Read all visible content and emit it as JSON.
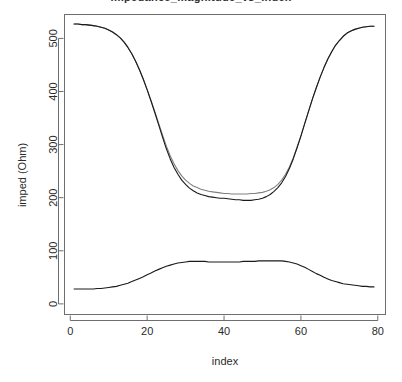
{
  "chart_data": {
    "type": "line",
    "title": "impedance_magnitude_vs_index",
    "xlabel": "index",
    "ylabel": "imped (Ohm)",
    "xlim": [
      -1.5,
      82
    ],
    "ylim": [
      -20,
      545
    ],
    "xticks": [
      0,
      20,
      40,
      60,
      80
    ],
    "yticks": [
      0,
      100,
      200,
      300,
      400,
      500
    ],
    "grid": false,
    "legend": "none",
    "x": [
      1,
      2,
      3,
      4,
      5,
      6,
      7,
      8,
      9,
      10,
      11,
      12,
      13,
      14,
      15,
      16,
      17,
      18,
      19,
      20,
      21,
      22,
      23,
      24,
      25,
      26,
      27,
      28,
      29,
      30,
      31,
      32,
      33,
      34,
      35,
      36,
      37,
      38,
      39,
      40,
      41,
      42,
      43,
      44,
      45,
      46,
      47,
      48,
      49,
      50,
      51,
      52,
      53,
      54,
      55,
      56,
      57,
      58,
      59,
      60,
      61,
      62,
      63,
      64,
      65,
      66,
      67,
      68,
      69,
      70,
      71,
      72,
      73,
      74,
      75,
      76,
      77,
      78,
      79
    ],
    "series": [
      {
        "name": "imped-measured",
        "color": "#808080",
        "values": [
          527,
          527,
          526,
          526,
          525,
          524,
          523,
          521,
          519,
          516,
          512,
          507,
          501,
          493,
          483,
          471,
          457,
          441,
          423,
          404,
          383,
          362,
          340,
          318,
          297,
          279,
          264,
          251,
          241,
          233,
          227,
          222,
          219,
          216,
          214,
          212,
          211,
          210,
          209,
          208,
          208,
          207,
          207,
          207,
          207,
          207,
          208,
          208,
          209,
          210,
          212,
          215,
          219,
          225,
          233,
          244,
          258,
          275,
          295,
          317,
          340,
          363,
          386,
          407,
          427,
          445,
          461,
          475,
          487,
          496,
          504,
          510,
          514,
          517,
          519,
          521,
          522,
          523,
          523
        ]
      },
      {
        "name": "imped-fitted",
        "color": "#1a1a1a",
        "values": [
          527,
          527,
          526,
          526,
          525,
          524,
          523,
          521,
          519,
          516,
          512,
          507,
          501,
          493,
          483,
          471,
          457,
          441,
          423,
          403,
          382,
          360,
          337,
          314,
          292,
          273,
          257,
          244,
          233,
          225,
          218,
          213,
          209,
          206,
          204,
          202,
          201,
          200,
          199,
          199,
          198,
          197,
          196,
          196,
          195,
          195,
          195,
          196,
          197,
          199,
          202,
          206,
          212,
          219,
          228,
          240,
          255,
          273,
          294,
          316,
          340,
          363,
          386,
          407,
          427,
          445,
          461,
          475,
          487,
          496,
          504,
          510,
          514,
          517,
          519,
          521,
          522,
          523,
          523
        ]
      },
      {
        "name": "imped-phase-component",
        "color": "#1a1a1a",
        "values": [
          28,
          28,
          28,
          28,
          28,
          28,
          29,
          29,
          30,
          31,
          32,
          33,
          35,
          37,
          39,
          42,
          45,
          48,
          51,
          55,
          58,
          62,
          65,
          68,
          71,
          73,
          75,
          77,
          78,
          79,
          80,
          80,
          80,
          80,
          80,
          79,
          79,
          79,
          79,
          79,
          79,
          79,
          79,
          79,
          80,
          80,
          80,
          80,
          81,
          81,
          81,
          81,
          81,
          81,
          81,
          80,
          79,
          77,
          75,
          72,
          69,
          65,
          61,
          57,
          54,
          50,
          47,
          44,
          42,
          40,
          38,
          37,
          36,
          35,
          34,
          33,
          33,
          32,
          32
        ]
      }
    ]
  }
}
